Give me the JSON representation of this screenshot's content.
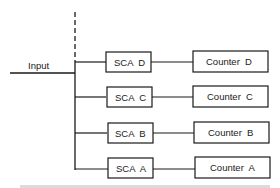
{
  "diagram": {
    "input_label": "Input",
    "channels": [
      {
        "sca": "SCA  D",
        "counter": "Counter  D",
        "y": 52
      },
      {
        "sca": "SCA  C",
        "counter": "Counter  C",
        "y": 87
      },
      {
        "sca": "SCA  B",
        "counter": "Counter  B",
        "y": 123
      },
      {
        "sca": "SCA  A",
        "counter": "Counter  A",
        "y": 158
      }
    ],
    "footer_text": "partially visible text line (cropped)"
  }
}
